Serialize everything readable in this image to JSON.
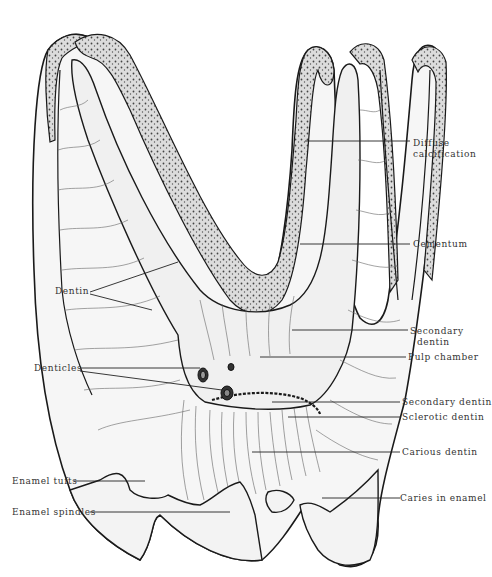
{
  "figure": {
    "colors": {
      "outline": "#1a1a1a",
      "tubule_line": "#555555",
      "cementum_fill": "#d9d9d9",
      "cementum_dots": "#333333",
      "pulp_fill": "#f2f2f2",
      "enamel_fill": "#f4f4f4",
      "leader_line": "#222222"
    }
  },
  "labels": {
    "left": {
      "dentin": "Dentin",
      "denticles": "Denticles",
      "enamel_tufts": "Enamel tufts",
      "enamel_spindles": "Enamel spindles"
    },
    "right": {
      "diffuse_calcification": "Diffuse\ncalcification",
      "cementum": "Cementum",
      "secondary_dentin_upper": "Secondary\n  dentin",
      "pulp_chamber": "Pulp chamber",
      "secondary_dentin_lower": "Secondary dentin",
      "sclerotic_dentin": "Sclerotic dentin",
      "carious_dentin": "Carious dentin",
      "caries_in_enamel": "Caries in enamel"
    }
  }
}
